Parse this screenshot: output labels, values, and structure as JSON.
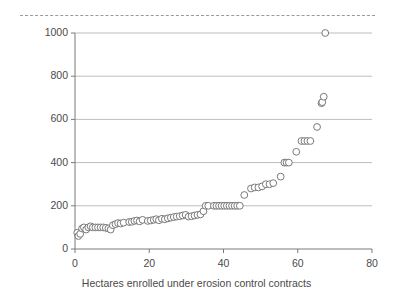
{
  "chart_data": {
    "type": "scatter",
    "title": "",
    "xlabel": "Hectares enrolled under erosion control contracts",
    "ylabel": "Landholder bids (WTA) soil\nconservation contracts",
    "xlim": [
      0,
      80
    ],
    "ylim": [
      0,
      1000
    ],
    "xticks": [
      0,
      20,
      40,
      60,
      80
    ],
    "yticks": [
      0,
      200,
      400,
      600,
      800,
      1000
    ],
    "xtick_labels": [
      "0",
      "20",
      "40",
      "60",
      "80"
    ],
    "ytick_labels": [
      "0",
      "200",
      "400",
      "600",
      "800",
      "1000"
    ],
    "grid": "horizontal",
    "legend": "none",
    "marker": "open-circle",
    "marker_fill": "#ffffff",
    "marker_stroke": "#6b6b6b",
    "marker_radius": 3.4,
    "axis_color": "#7a7a7a",
    "grid_color": "#bdbdbd",
    "text_color": "#4a4a4a",
    "series": [
      {
        "name": "Landholder bids",
        "points": [
          [
            0.6,
            75
          ],
          [
            0.9,
            60
          ],
          [
            1.4,
            70
          ],
          [
            1.9,
            95
          ],
          [
            2.4,
            100
          ],
          [
            3.0,
            90
          ],
          [
            3.6,
            100
          ],
          [
            4.2,
            105
          ],
          [
            4.8,
            100
          ],
          [
            5.5,
            100
          ],
          [
            6.2,
            100
          ],
          [
            6.9,
            100
          ],
          [
            7.6,
            100
          ],
          [
            8.3,
            98
          ],
          [
            9.0,
            95
          ],
          [
            9.6,
            90
          ],
          [
            10.2,
            110
          ],
          [
            10.9,
            115
          ],
          [
            11.6,
            120
          ],
          [
            12.3,
            118
          ],
          [
            13.1,
            122
          ],
          [
            14.6,
            125
          ],
          [
            15.3,
            126
          ],
          [
            16.0,
            130
          ],
          [
            16.7,
            132
          ],
          [
            17.4,
            128
          ],
          [
            18.2,
            135
          ],
          [
            19.6,
            130
          ],
          [
            20.4,
            132
          ],
          [
            21.2,
            135
          ],
          [
            21.9,
            138
          ],
          [
            22.6,
            133
          ],
          [
            23.4,
            140
          ],
          [
            24.2,
            138
          ],
          [
            25.0,
            142
          ],
          [
            25.8,
            145
          ],
          [
            26.6,
            148
          ],
          [
            27.4,
            150
          ],
          [
            28.2,
            152
          ],
          [
            29.0,
            155
          ],
          [
            29.8,
            158
          ],
          [
            30.6,
            150
          ],
          [
            31.4,
            152
          ],
          [
            32.2,
            155
          ],
          [
            33.0,
            158
          ],
          [
            33.8,
            160
          ],
          [
            34.6,
            175
          ],
          [
            35.2,
            200
          ],
          [
            35.9,
            200
          ],
          [
            37.4,
            200
          ],
          [
            38.1,
            200
          ],
          [
            38.8,
            200
          ],
          [
            39.5,
            200
          ],
          [
            40.2,
            200
          ],
          [
            40.9,
            200
          ],
          [
            41.6,
            200
          ],
          [
            42.3,
            200
          ],
          [
            43.0,
            200
          ],
          [
            43.7,
            200
          ],
          [
            44.4,
            200
          ],
          [
            45.6,
            250
          ],
          [
            47.4,
            280
          ],
          [
            48.4,
            285
          ],
          [
            49.4,
            285
          ],
          [
            50.4,
            290
          ],
          [
            51.4,
            300
          ],
          [
            52.4,
            300
          ],
          [
            53.4,
            305
          ],
          [
            55.4,
            335
          ],
          [
            56.4,
            400
          ],
          [
            57.0,
            400
          ],
          [
            57.6,
            400
          ],
          [
            59.6,
            450
          ],
          [
            61.0,
            500
          ],
          [
            61.8,
            500
          ],
          [
            62.6,
            500
          ],
          [
            63.4,
            500
          ],
          [
            65.2,
            565
          ],
          [
            66.4,
            675
          ],
          [
            66.6,
            680
          ],
          [
            67.0,
            705
          ],
          [
            67.4,
            1000
          ]
        ]
      }
    ],
    "annotations": {
      "top_rule": "dashed-separator"
    }
  }
}
